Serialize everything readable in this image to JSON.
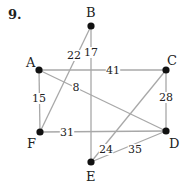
{
  "problem_number": "9.",
  "colors": {
    "edge": "#a8a8a8",
    "vertex": "#111111",
    "text": "#222222"
  },
  "vertices": [
    {
      "id": "A",
      "label": "A",
      "x": 39,
      "y": 70,
      "lx": 26,
      "ly": 67
    },
    {
      "id": "B",
      "label": "B",
      "x": 91,
      "y": 26,
      "lx": 86,
      "ly": 17
    },
    {
      "id": "C",
      "label": "C",
      "x": 166,
      "y": 70,
      "lx": 167,
      "ly": 65
    },
    {
      "id": "D",
      "label": "D",
      "x": 166,
      "y": 131,
      "lx": 169,
      "ly": 148
    },
    {
      "id": "E",
      "label": "E",
      "x": 91,
      "y": 162,
      "lx": 86,
      "ly": 181
    },
    {
      "id": "F",
      "label": "F",
      "x": 40,
      "y": 132,
      "lx": 27,
      "ly": 148
    }
  ],
  "edges": [
    {
      "from": "A",
      "to": "C",
      "weight": "41",
      "wx": 113,
      "wy": 74
    },
    {
      "from": "A",
      "to": "F",
      "weight": "15",
      "wx": 39,
      "wy": 102
    },
    {
      "from": "A",
      "to": "D",
      "weight": "8",
      "wx": 76,
      "wy": 91
    },
    {
      "from": "B",
      "to": "F",
      "weight": "22",
      "wx": 74,
      "wy": 59
    },
    {
      "from": "B",
      "to": "E",
      "weight": "17",
      "wx": 91,
      "wy": 56
    },
    {
      "from": "C",
      "to": "D",
      "weight": "28",
      "wx": 166,
      "wy": 101
    },
    {
      "from": "C",
      "to": "E",
      "weight": "24",
      "wx": 106,
      "wy": 153
    },
    {
      "from": "F",
      "to": "D",
      "weight": "31",
      "wx": 67,
      "wy": 136
    },
    {
      "from": "E",
      "to": "D",
      "weight": "35",
      "wx": 135,
      "wy": 153
    }
  ]
}
